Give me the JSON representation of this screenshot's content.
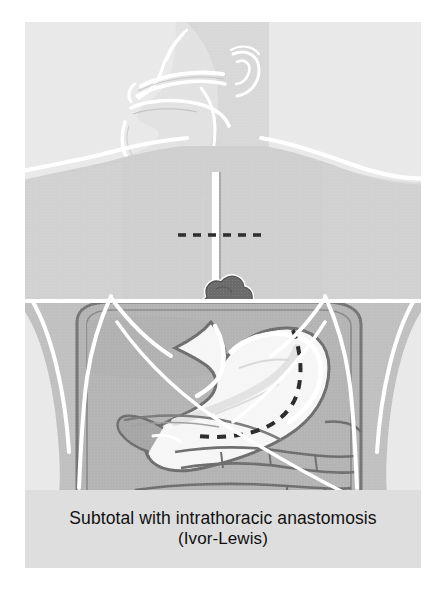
{
  "figure": {
    "domain": "medical-illustration",
    "view": "anterior torso with sagittal head profile"
  },
  "caption": {
    "line1": "Subtotal with intrathoracic anastomosis",
    "line2": "(Ivor-Lewis)"
  },
  "colors": {
    "page_background": "#ffffff",
    "plate_background": "#e9e9e9",
    "caption_background": "#dedede",
    "body_silhouette": "#efefef",
    "thorax_fill": "#c9c9c9",
    "abdomen_fill": "#b8b8b8",
    "organ_fill": "#a9a9a9",
    "stomach_lumen": "#f4f4f4",
    "stomach_wall_line": "#6e6e6e",
    "outline_white": "#ffffff",
    "tumor_fill": "#6b6b6b",
    "resection_dash": "#2a2a2a",
    "caption_text": "#111111"
  },
  "anatomy": {
    "head": {
      "label": "sagittal head profile",
      "features": [
        "nose",
        "lips",
        "tongue",
        "hard palate",
        "soft palate",
        "mandible",
        "ear",
        "pharynx"
      ]
    },
    "esophagus": {
      "label": "esophagus",
      "description": "narrow vertical tube from pharynx through thorax to stomach"
    },
    "tumor": {
      "label": "esophageal tumor",
      "shape": "lobulated mass",
      "location": "distal esophagus at the diaphragmatic hiatus"
    },
    "diaphragm": {
      "label": "diaphragm",
      "description": "horizontal white line separating thorax from abdomen"
    },
    "stomach": {
      "label": "stomach",
      "parts": [
        "fundus",
        "body",
        "lesser curvature",
        "greater curvature",
        "antrum",
        "pylorus"
      ]
    },
    "duodenum": {
      "label": "duodenum"
    },
    "pancreas": {
      "label": "pancreas"
    },
    "colon": {
      "label": "transverse colon"
    },
    "ribs": {
      "label": "costal margin"
    }
  },
  "markings": {
    "proximal_resection_line": {
      "label": "proximal esophageal resection margin",
      "style": "horizontal dashed line",
      "location": "mid thoracic esophagus above the tumor"
    },
    "gastric_resection_line": {
      "label": "gastric resection margin",
      "style": "curved dashed line",
      "location": "through the gastric fundus and lesser curvature"
    }
  }
}
